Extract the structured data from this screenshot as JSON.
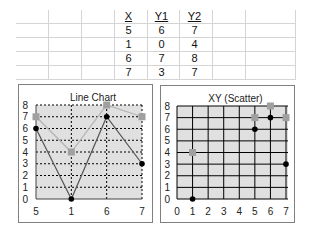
{
  "table": {
    "headers": [
      "X",
      "Y1",
      "Y2"
    ],
    "rows": [
      [
        "5",
        "6",
        "7"
      ],
      [
        "1",
        "0",
        "4"
      ],
      [
        "6",
        "7",
        "8"
      ],
      [
        "7",
        "3",
        "7"
      ]
    ]
  },
  "colors": {
    "plot_bg": "#e0e0e0",
    "series_y1": "#000000",
    "series_y2": "#a0a0a0",
    "y1_line": "#555555",
    "y2_line": "#b4b4b4",
    "grid_line": "#000000"
  },
  "chart_data": [
    {
      "type": "line",
      "title": "Line Chart",
      "categories": [
        "5",
        "1",
        "6",
        "7"
      ],
      "series": [
        {
          "name": "Y1",
          "values": [
            6,
            0,
            7,
            3
          ]
        },
        {
          "name": "Y2",
          "values": [
            7,
            4,
            8,
            7
          ]
        }
      ],
      "xlabel": "",
      "ylabel": "",
      "ylim": [
        0,
        8
      ],
      "yticks": [
        "0",
        "1",
        "2",
        "3",
        "4",
        "5",
        "6",
        "7",
        "8"
      ],
      "grid": "dotted"
    },
    {
      "type": "scatter",
      "title": "XY (Scatter)",
      "series": [
        {
          "name": "Y1",
          "x": [
            5,
            1,
            6,
            7
          ],
          "y": [
            6,
            0,
            7,
            3
          ]
        },
        {
          "name": "Y2",
          "x": [
            5,
            1,
            6,
            7
          ],
          "y": [
            7,
            4,
            8,
            7
          ]
        }
      ],
      "xlabel": "",
      "ylabel": "",
      "xlim": [
        0,
        7
      ],
      "ylim": [
        0,
        8
      ],
      "xticks": [
        "0",
        "1",
        "2",
        "3",
        "4",
        "5",
        "6",
        "7"
      ],
      "yticks": [
        "0",
        "1",
        "2",
        "3",
        "4",
        "5",
        "6",
        "7",
        "8"
      ],
      "grid": "solid"
    }
  ]
}
